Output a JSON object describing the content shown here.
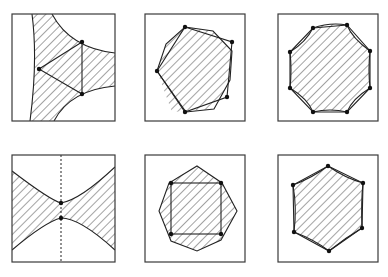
{
  "figure": {
    "colors": {
      "stroke": "#222222",
      "frame": "#3a3a3a",
      "hatch": "#333333",
      "background": "#ffffff"
    },
    "panels": [
      {
        "id": "p1",
        "row": 1,
        "col": 1,
        "label": "hyperbolic-triangle",
        "vertices": 3
      },
      {
        "id": "p2",
        "row": 1,
        "col": 2,
        "label": "two-rotated-octagons",
        "vertices": 4
      },
      {
        "id": "p3",
        "row": 1,
        "col": 3,
        "label": "octagon-with-concave-edges",
        "vertices": 8
      },
      {
        "id": "p4",
        "row": 2,
        "col": 1,
        "label": "bowtie-with-dashed-axis",
        "vertices": 2
      },
      {
        "id": "p5",
        "row": 2,
        "col": 2,
        "label": "square-inside-hexagon",
        "vertices": 4
      },
      {
        "id": "p6",
        "row": 2,
        "col": 3,
        "label": "hexagon-with-concave-edges",
        "vertices": 6
      }
    ]
  }
}
